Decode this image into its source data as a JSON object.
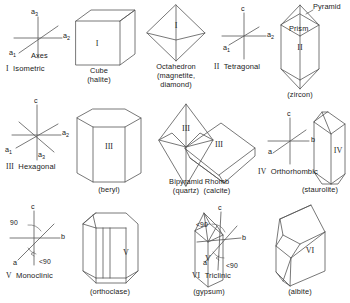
{
  "figure": {
    "stroke_color": "#555555",
    "text_color": "#1a1a1a",
    "background": "#ffffff"
  },
  "systems": [
    {
      "numeral": "I",
      "name": "Isometric",
      "system_label": "I  Isometric",
      "axes_caption": "Axes",
      "axis_labels": [
        "a₃",
        "a₂",
        "a₁"
      ],
      "forms": [
        {
          "numeral": "I",
          "form_name": "Cube",
          "mineral": "(halite)"
        },
        {
          "numeral": "I",
          "form_name": "Octahedron",
          "mineral": "(magnetite,\ndiamond)",
          "mineral_line1": "(magnetite,",
          "mineral_line2": "diamond)"
        }
      ]
    },
    {
      "numeral": "II",
      "name": "Tetragonal",
      "system_label": "II  Tetragonal",
      "axis_labels": [
        "c",
        "a₂",
        "a₁"
      ],
      "forms": [
        {
          "numeral": "II",
          "form_name": "Prism",
          "secondary_name": "Pyramid",
          "mineral": "(zircon)"
        }
      ]
    },
    {
      "numeral": "III",
      "name": "Hexagonal",
      "system_label": "III  Hexagonal",
      "axis_labels": [
        "c",
        "a₂",
        "a₁",
        "a₃"
      ],
      "forms": [
        {
          "numeral": "III",
          "form_name": "",
          "mineral": "(beryl)"
        },
        {
          "numeral": "III",
          "form_name": "Bipyramid",
          "mineral": "(quartz)"
        },
        {
          "numeral": "III",
          "form_name": "Rhomb",
          "mineral": "(calcite)"
        }
      ]
    },
    {
      "numeral": "IV",
      "name": "Orthorhombic",
      "system_label": "IV  Orthorhombic",
      "axis_labels": [
        "c",
        "b",
        "a"
      ],
      "forms": [
        {
          "numeral": "IV",
          "form_name": "",
          "mineral": "(staurolite)"
        }
      ]
    },
    {
      "numeral": "V",
      "name": "Monoclinic",
      "system_label": "V  Monoclinic",
      "axis_labels": [
        "c",
        "b",
        "a"
      ],
      "angle_labels": [
        "90",
        "<90"
      ],
      "forms": [
        {
          "numeral": "V",
          "form_name": "",
          "mineral": "(orthoclase)"
        },
        {
          "numeral": "V",
          "form_name": "",
          "mineral": "(gypsum)"
        }
      ]
    },
    {
      "numeral": "VI",
      "name": "Triclinic",
      "system_label": "VI  Triclinic",
      "axis_labels": [
        "c",
        "b",
        "a"
      ],
      "angle_labels": [
        "<90",
        "<90"
      ],
      "forms": [
        {
          "numeral": "VI",
          "form_name": "",
          "mineral": "(albite)"
        }
      ]
    }
  ],
  "labels": {
    "isometric_a3": "a",
    "isometric_a3_sub": "3",
    "isometric_a2": "a",
    "isometric_a2_sub": "2",
    "isometric_a1": "a",
    "isometric_a1_sub": "1",
    "axes_word": "Axes",
    "isometric_system": "Isometric",
    "isometric_numeral": "I",
    "cube_name": "Cube",
    "cube_mineral": "(halite)",
    "cube_face": "I",
    "octahedron_name": "Octahedron",
    "octahedron_mineral_1": "(magnetite,",
    "octahedron_mineral_2": "diamond)",
    "octahedron_face": "I",
    "tetragonal_c": "c",
    "tetragonal_a2": "a",
    "tetragonal_a2_sub": "2",
    "tetragonal_a1": "a",
    "tetragonal_a1_sub": "1",
    "tetragonal_system": "Tetragonal",
    "tetragonal_numeral": "II",
    "pyramid_word": "Pyramid",
    "prism_word": "Prism",
    "zircon_face": "II",
    "zircon_mineral": "(zircon)",
    "hexagonal_c": "c",
    "hexagonal_a2": "a",
    "hexagonal_a2_sub": "2",
    "hexagonal_a1": "a",
    "hexagonal_a1_sub": "1",
    "hexagonal_a3": "a",
    "hexagonal_a3_sub": "3",
    "hexagonal_system": "Hexagonal",
    "hexagonal_numeral": "III",
    "beryl_face": "III",
    "beryl_mineral": "(beryl)",
    "bipyramid_name": "Bipyramid",
    "bipyramid_mineral": "(quartz)",
    "bipyramid_face": "III",
    "rhomb_name": "Rhomb",
    "rhomb_mineral": "(calcite)",
    "rhomb_face": "III",
    "ortho_c": "c",
    "ortho_b": "b",
    "ortho_a": "a",
    "ortho_system": "Orthorhombic",
    "ortho_numeral": "IV",
    "staurolite_face": "IV",
    "staurolite_mineral": "(staurolite)",
    "mono_c": "c",
    "mono_b": "b",
    "mono_a": "a",
    "mono_angle_90": "90",
    "mono_angle_lt90": "<90",
    "mono_system": "Monoclinic",
    "mono_numeral": "V",
    "orthoclase_face": "V",
    "orthoclase_mineral": "(orthoclase)",
    "gypsum_face": "V",
    "gypsum_mineral": "(gypsum)",
    "tri_c": "c",
    "tri_b": "b",
    "tri_a": "a",
    "tri_angle_1": "<90",
    "tri_angle_2": "<90",
    "tri_system": "Triclinic",
    "tri_numeral": "VI",
    "albite_face": "VI",
    "albite_mineral": "(albite)"
  }
}
